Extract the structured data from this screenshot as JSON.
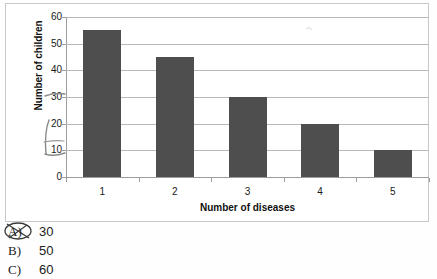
{
  "chart_data": {
    "type": "bar",
    "title": "",
    "categories": [
      "1",
      "2",
      "3",
      "4",
      "5"
    ],
    "values": [
      55,
      45,
      30,
      20,
      10
    ],
    "xlabel": "Number of diseases",
    "ylabel": "Number of children",
    "ylim": [
      0,
      60
    ],
    "yticks": [
      0,
      10,
      20,
      30,
      40,
      50,
      60
    ],
    "ytick_labels": [
      "0",
      "10",
      "20",
      "30",
      "40",
      "50",
      "60"
    ],
    "grid": true,
    "legend": "none",
    "bar_color": "#4e4e4e",
    "gridline_color": "#b9b9b9",
    "axis_color": "#9c9c9c"
  },
  "chart": {
    "y_axis_title": "Number of children",
    "x_axis_title": "Number of diseases",
    "y_tick_labels": [
      "60",
      "50",
      "40",
      "30",
      "20",
      "10",
      "0"
    ],
    "x_tick_labels": [
      "1",
      "2",
      "3",
      "4",
      "5"
    ]
  },
  "annotations": {
    "pencil_marks_present": true,
    "circled_option": "A"
  },
  "options": [
    {
      "letter": "A)",
      "value": "30",
      "marked": true
    },
    {
      "letter": "B)",
      "value": "50",
      "marked": false
    },
    {
      "letter": "C)",
      "value": "60",
      "marked": false
    }
  ]
}
